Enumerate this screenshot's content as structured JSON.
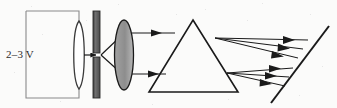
{
  "figure": {
    "background_color": "#fbfbfa",
    "width": 337,
    "height": 108
  },
  "labels": {
    "voltage": "2–3 V"
  },
  "colors": {
    "ink": "#1a1a1a",
    "circuit_wire": "#8a8a8a",
    "slit_fill": "#6e6e6e",
    "slit_stroke": "#2a2a2a",
    "lens_fill": "#8f8f8f",
    "lens_stroke": "#1a1a1a",
    "lamp_stroke": "#3a3a3a",
    "lamp_fill": "#ffffff",
    "prism_stroke": "#1a1a1a",
    "ray": "#1a1a1a",
    "screen": "#1a1a1a",
    "background": "#fbfbfa"
  },
  "components": {
    "power_supply": {
      "name": "battery-circuit",
      "shape": "rectangle",
      "x": 26,
      "y": 11,
      "width": 53,
      "height": 87,
      "label": "2–3 V"
    },
    "lamp": {
      "name": "lamp-bulb",
      "shape": "vertical-capsule",
      "cx": 79,
      "cy": 55,
      "rx": 7,
      "ry": 34
    },
    "slit_screen": {
      "name": "slit-screen",
      "shape": "vertical-bar-with-gap",
      "x": 93,
      "y": 11,
      "width": 7,
      "height": 87,
      "gap_y": 53,
      "gap_height": 4
    },
    "lens": {
      "name": "converging-lens",
      "shape": "ellipse",
      "cx": 124,
      "cy": 55,
      "rx": 9,
      "ry": 35
    },
    "prism": {
      "name": "triangular-prism",
      "shape": "triangle",
      "apex_x": 193,
      "apex_y": 20,
      "base_left_x": 149,
      "base_right_x": 238,
      "base_y": 92
    },
    "screen": {
      "name": "projection-screen",
      "shape": "tilted-line",
      "x1": 329,
      "y1": 27,
      "x2": 271,
      "y2": 103
    }
  },
  "rays": {
    "slit_to_lens": [
      {
        "x1": 100,
        "y1": 55,
        "x2": 122,
        "y2": 35
      },
      {
        "x1": 100,
        "y1": 55,
        "x2": 122,
        "y2": 74
      }
    ],
    "lens_to_prism": [
      {
        "x1": 131,
        "y1": 33,
        "x2": 172,
        "y2": 33
      },
      {
        "x1": 131,
        "y1": 74,
        "x2": 163,
        "y2": 74
      }
    ],
    "dispersed_upper": [
      {
        "x1": 216,
        "y1": 38,
        "x2": 306,
        "y2": 42
      },
      {
        "x1": 216,
        "y1": 38,
        "x2": 302,
        "y2": 51
      },
      {
        "x1": 216,
        "y1": 38,
        "x2": 297,
        "y2": 59
      }
    ],
    "dispersed_lower": [
      {
        "x1": 228,
        "y1": 74,
        "x2": 290,
        "y2": 70
      },
      {
        "x1": 228,
        "y1": 74,
        "x2": 287,
        "y2": 79
      },
      {
        "x1": 228,
        "y1": 74,
        "x2": 283,
        "y2": 87
      }
    ],
    "arrow_count_upper": 3,
    "arrow_count_lower": 3
  }
}
